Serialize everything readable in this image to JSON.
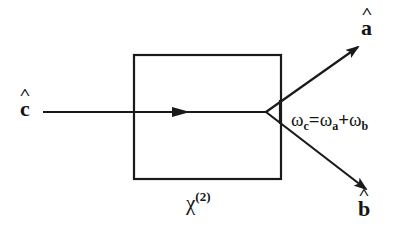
{
  "diagram": {
    "type": "nonlinear optical process (parametric down-conversion)",
    "input_mode": {
      "label": "c",
      "hat": true
    },
    "output_modes": [
      {
        "label": "a",
        "hat": true,
        "direction": "upper-right"
      },
      {
        "label": "b",
        "hat": true,
        "direction": "lower-right"
      }
    ],
    "medium": {
      "label": "χ",
      "superscript": "(2)"
    },
    "relation": {
      "lhs_symbol": "ω",
      "lhs_sub": "c",
      "eq": "=",
      "t1_symbol": "ω",
      "t1_sub": "a",
      "plus": "+",
      "t2_symbol": "ω",
      "t2_sub": "b"
    },
    "colors": {
      "stroke": "#1a1a1a",
      "background": "#ffffff"
    }
  }
}
